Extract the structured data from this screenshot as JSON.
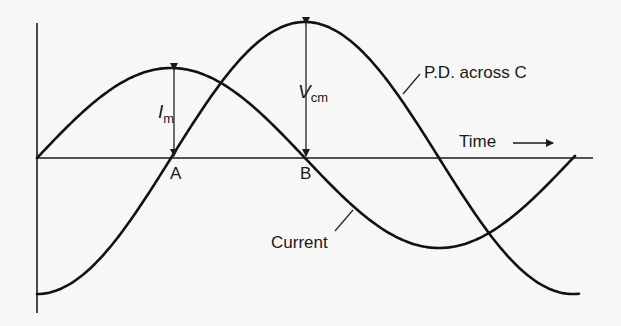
{
  "diagram": {
    "labels": {
      "pd": "P.D. across C",
      "current": "Current",
      "time": "Time",
      "point_a": "A",
      "point_b": "B",
      "im_main": "I",
      "im_sub": "m",
      "vcm_main": "V",
      "vcm_sub": "cm"
    },
    "icons": {
      "time_arrow": "right-arrow"
    },
    "colors": {
      "background": "#f7f7f5",
      "ink": "#111111"
    },
    "geometry": {
      "origin": [
        37,
        158
      ],
      "y_axis_top": 23,
      "y_axis_bottom": 313,
      "x_axis_end": 593,
      "quarter_period_px": 134,
      "current_amplitude_px": 90,
      "voltage_amplitude_px": 136
    }
  }
}
